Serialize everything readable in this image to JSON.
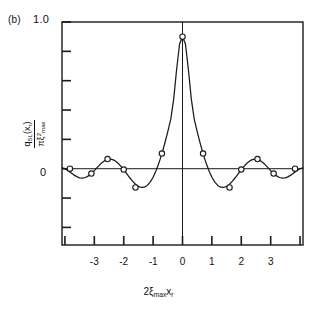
{
  "figure": {
    "panel_label": "(b)",
    "background_color": "#ffffff",
    "line_color": "#1a1a1a",
    "marker_face_color": "#ffffff",
    "marker_edge_color": "#1a1a1a"
  },
  "axes": {
    "y_top_label": "1.0",
    "y_zero_label": "0",
    "y_label_numerator_q": "q",
    "y_label_numerator_sub": "SL",
    "y_label_numerator_arg": "(x",
    "y_label_numerator_arg_sub": "r",
    "y_label_numerator_arg_close": ")",
    "y_label_denominator_pi": "π",
    "y_label_denominator_xi": "ξ",
    "y_label_denominator_sup": "2",
    "y_label_denominator_sub": "max",
    "x_label_coef": "2",
    "x_label_xi": "ξ",
    "x_label_xi_sub": "max",
    "x_label_x": "x",
    "x_label_x_sub": "r",
    "x_tick_labels": [
      "-3",
      "-2",
      "-1",
      "0",
      "1",
      "2",
      "3"
    ],
    "x_tick_values": [
      -3,
      -2,
      -1,
      0,
      1,
      2,
      3
    ],
    "x_extra_tick_values": [
      -4,
      4
    ],
    "y_tick_values": [
      1.0,
      0.8,
      0.6,
      0.4,
      0.2,
      0.0,
      -0.2,
      -0.4
    ],
    "xlim": [
      -4.1,
      4.1
    ],
    "ylim": [
      -0.52,
      1.0
    ]
  },
  "chart_data": {
    "type": "line",
    "title": "",
    "subtitle": "",
    "xlabel": "2ξ_max x_r",
    "ylabel": "q_SL(x_r) / (π ξ^2_max)",
    "xlim": [
      -4.1,
      4.1
    ],
    "ylim": [
      -0.52,
      1.0
    ],
    "grid": false,
    "legend": "none",
    "annotations": [
      "(b)"
    ],
    "series": [
      {
        "name": "sidelobe-response",
        "description": "Normalized jinc-type sidelobe response 2*J1(pi*u)/(pi*u) scaled so peak equals 0.9",
        "x": [
          -4.1,
          -4.0,
          -3.9,
          -3.8,
          -3.7,
          -3.6,
          -3.5,
          -3.4,
          -3.3,
          -3.2,
          -3.1,
          -3.0,
          -2.9,
          -2.8,
          -2.7,
          -2.6,
          -2.5,
          -2.4,
          -2.3,
          -2.2,
          -2.1,
          -2.0,
          -1.9,
          -1.8,
          -1.7,
          -1.6,
          -1.5,
          -1.4,
          -1.3,
          -1.2,
          -1.1,
          -1.0,
          -0.9,
          -0.8,
          -0.7,
          -0.6,
          -0.5,
          -0.4,
          -0.3,
          -0.2,
          -0.1,
          0.0,
          0.1,
          0.2,
          0.3,
          0.4,
          0.5,
          0.6,
          0.7,
          0.8,
          0.9,
          1.0,
          1.1,
          1.2,
          1.3,
          1.4,
          1.5,
          1.6,
          1.7,
          1.8,
          1.9,
          2.0,
          2.1,
          2.2,
          2.3,
          2.4,
          2.5,
          2.6,
          2.7,
          2.8,
          2.9,
          3.0,
          3.1,
          3.2,
          3.3,
          3.4,
          3.5,
          3.6,
          3.7,
          3.8,
          3.9,
          4.0,
          4.1
        ],
        "y": [
          0.005,
          0.0,
          -0.012,
          -0.027,
          -0.042,
          -0.054,
          -0.062,
          -0.064,
          -0.06,
          -0.049,
          -0.033,
          -0.013,
          0.009,
          0.03,
          0.048,
          0.06,
          0.066,
          0.064,
          0.055,
          0.039,
          0.018,
          -0.006,
          -0.033,
          -0.06,
          -0.085,
          -0.106,
          -0.121,
          -0.128,
          -0.126,
          -0.114,
          -0.091,
          -0.058,
          -0.014,
          0.04,
          0.103,
          0.175,
          0.253,
          0.336,
          0.474,
          0.676,
          0.85,
          0.9,
          0.85,
          0.676,
          0.474,
          0.336,
          0.253,
          0.175,
          0.103,
          0.04,
          -0.014,
          -0.058,
          -0.091,
          -0.114,
          -0.126,
          -0.128,
          -0.121,
          -0.106,
          -0.085,
          -0.06,
          -0.033,
          -0.006,
          0.018,
          0.039,
          0.055,
          0.064,
          0.066,
          0.06,
          0.048,
          0.03,
          0.009,
          -0.013,
          -0.033,
          -0.049,
          -0.06,
          -0.064,
          -0.062,
          -0.054,
          -0.042,
          -0.027,
          -0.012,
          0.0,
          0.005
        ]
      }
    ],
    "markers": [
      {
        "x": -3.83,
        "y": 0.0
      },
      {
        "x": -3.1,
        "y": -0.033
      },
      {
        "x": -2.55,
        "y": 0.066
      },
      {
        "x": -2.0,
        "y": -0.006
      },
      {
        "x": -1.6,
        "y": -0.128
      },
      {
        "x": -0.7,
        "y": 0.103
      },
      {
        "x": 0.0,
        "y": 0.9
      },
      {
        "x": 0.7,
        "y": 0.103
      },
      {
        "x": 1.6,
        "y": -0.128
      },
      {
        "x": 2.0,
        "y": -0.006
      },
      {
        "x": 2.55,
        "y": 0.066
      },
      {
        "x": 3.1,
        "y": -0.033
      },
      {
        "x": 3.83,
        "y": 0.0
      }
    ],
    "zero_crossings": [
      -3.83,
      -2.92,
      -2.23,
      -1.22,
      1.22,
      2.23,
      2.92,
      3.83
    ],
    "peak_value": 0.9,
    "peak_x": 0.0
  }
}
